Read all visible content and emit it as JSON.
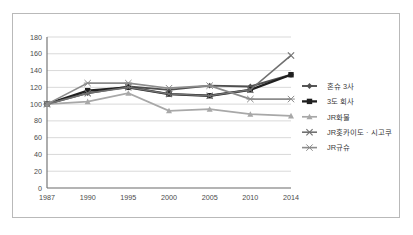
{
  "chart_data": {
    "type": "line",
    "title": "",
    "subtitle": "",
    "xlabel": "",
    "ylabel": "",
    "x": [
      "1987",
      "1990",
      "1995",
      "2000",
      "2005",
      "2010",
      "2014"
    ],
    "categories": [
      "1987",
      "1990",
      "1995",
      "2000",
      "2005",
      "2010",
      "2014"
    ],
    "ylim": [
      0,
      180
    ],
    "ytick_step": 20,
    "yticks": [
      "0",
      "20",
      "40",
      "60",
      "80",
      "100",
      "120",
      "140",
      "160",
      "180"
    ],
    "grid": "horizontal",
    "legend_position": "right",
    "series": [
      {
        "name": "혼슈 3사",
        "color": "#4f4f4f",
        "marker": "diamond",
        "values": [
          100,
          113,
          121,
          117,
          122,
          121,
          135
        ]
      },
      {
        "name": "3도 회사",
        "color": "#1f1f1f",
        "marker": "square",
        "values": [
          100,
          116,
          120,
          112,
          110,
          117,
          135
        ]
      },
      {
        "name": "JR화물",
        "color": "#a8a8a8",
        "marker": "triangle",
        "values": [
          100,
          103,
          113,
          92,
          94,
          88,
          86
        ]
      },
      {
        "name": "JR홋카이도 · 시코쿠",
        "color": "#707070",
        "marker": "cross",
        "values": [
          100,
          113,
          120,
          112,
          110,
          117,
          158
        ]
      },
      {
        "name": "JR규슈",
        "color": "#8c8c8c",
        "marker": "star",
        "values": [
          100,
          125,
          125,
          119,
          122,
          106,
          106
        ]
      }
    ]
  },
  "legend": {
    "items": [
      {
        "label": "혼슈 3사"
      },
      {
        "label": "3도 회사"
      },
      {
        "label": "JR화물"
      },
      {
        "label": "JR홋카이도 · 시고쿠"
      },
      {
        "label": "JR규슈"
      }
    ]
  },
  "colors": {
    "frame_border": "#b9b9b9",
    "gridline": "#c8c8c8",
    "axis": "#6b6b6b",
    "background": "#ffffff"
  }
}
